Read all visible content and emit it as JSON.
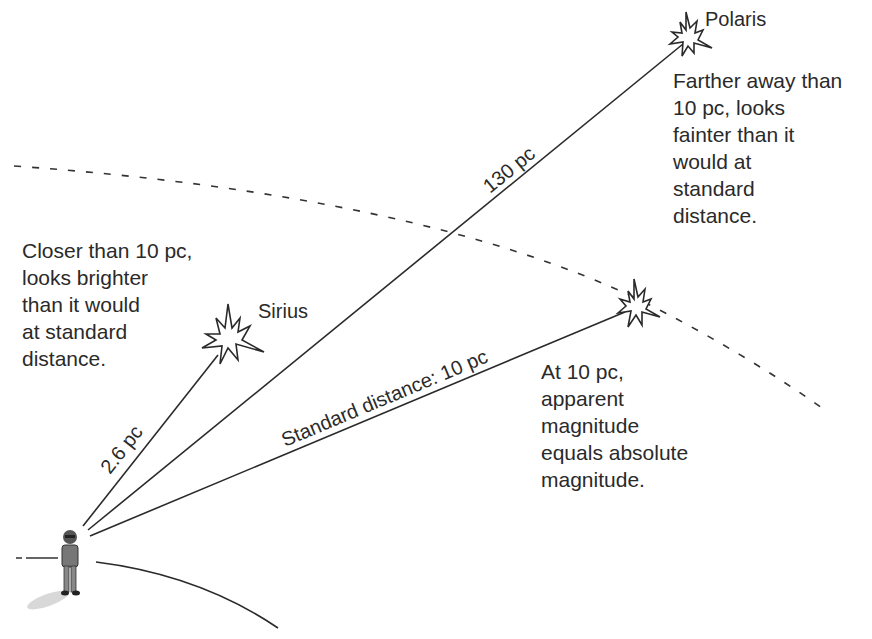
{
  "stars": {
    "polaris": {
      "name": "Polaris",
      "distance": "130 pc",
      "note": [
        "Farther away than",
        "10 pc, looks",
        "fainter than it",
        "would at",
        "standard",
        "distance."
      ]
    },
    "sirius": {
      "name": "Sirius",
      "distance": "2.6 pc",
      "note": [
        "Closer than 10 pc,",
        "looks brighter",
        "than it would",
        "at standard",
        "distance."
      ]
    },
    "standard": {
      "distance": "Standard distance: 10 pc",
      "note": [
        "At 10 pc,",
        "apparent",
        "magnitude",
        "equals absolute",
        "magnitude."
      ]
    }
  },
  "observer": {
    "label": "observer"
  },
  "colors": {
    "ink": "#2a2a2a",
    "background": "#ffffff"
  }
}
